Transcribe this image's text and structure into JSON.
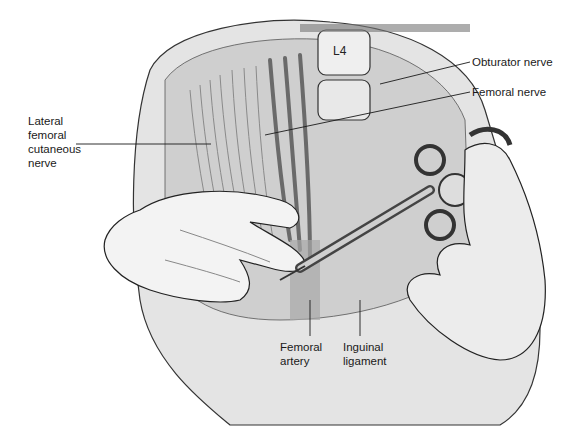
{
  "figure": {
    "vertebra_label": "L4",
    "labels": {
      "lateral_femoral_cutaneous_nerve": "Lateral\nfemoral\ncutaneous\nnerve",
      "obturator_nerve": "Obturator nerve",
      "femoral_nerve": "Femoral nerve",
      "femoral_artery": "Femoral\nartery",
      "inguinal_ligament": "Inguinal\nligament"
    },
    "colors": {
      "ink": "#1a1a1a",
      "shade_dark": "#555555",
      "shade_mid": "#9a9a9a",
      "shade_light": "#d6d6d6",
      "background": "#ffffff"
    }
  }
}
